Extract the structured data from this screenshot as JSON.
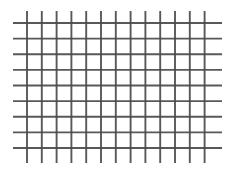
{
  "figure": {
    "background_color": "#ffffff",
    "width": 236,
    "height": 171
  },
  "chart_data": {
    "type": "line",
    "title": "",
    "subtitle": "",
    "xlabel": "",
    "ylabel": "",
    "grid": true,
    "legend_position": "none",
    "categories": [],
    "values": [],
    "axis_visible": false,
    "tick_labels_x": [],
    "tick_labels_y": [],
    "xlim": [
      0,
      236
    ],
    "ylim": [
      0,
      171
    ],
    "annotations": [],
    "series": [
      {
        "name": "vertical-lines",
        "orientation": "vertical",
        "count": 13,
        "color": "#4a4a4a",
        "stroke_width": 1.9,
        "opacity": 0.92,
        "span_start": 11,
        "span_end": 163,
        "positions": [
          27.0,
          41.8,
          56.6,
          71.4,
          86.2,
          101.0,
          115.8,
          130.6,
          145.4,
          160.2,
          175.0,
          189.8,
          204.6
        ]
      },
      {
        "name": "horizontal-lines",
        "orientation": "horizontal",
        "count": 9,
        "color": "#4a4a4a",
        "stroke_width": 1.9,
        "opacity": 0.92,
        "span_start": 13,
        "span_end": 222,
        "positions": [
          23.0,
          38.6,
          54.3,
          69.9,
          85.5,
          101.1,
          116.8,
          132.4,
          148.0
        ]
      }
    ]
  }
}
